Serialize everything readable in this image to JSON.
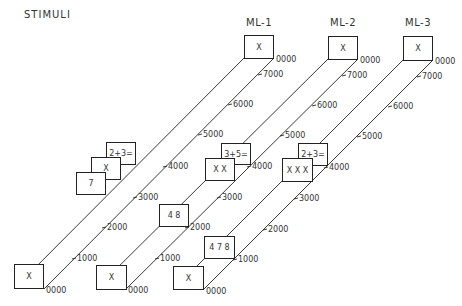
{
  "figure": {
    "stimuli_title": "STIMULI",
    "columns": [
      {
        "title": "ML-1",
        "title_pos": [
          246,
          17
        ],
        "rail": {
          "top_left": [
            244,
            58
          ],
          "top_right": [
            274,
            58
          ],
          "bot_left": [
            14,
            289
          ],
          "bot_right": [
            44,
            289
          ]
        },
        "ticks": [
          {
            "label": "0000",
            "x": 276,
            "y": 55
          },
          {
            "label": "7000",
            "x": 263,
            "y": 70
          },
          {
            "label": "6000",
            "x": 233,
            "y": 100
          },
          {
            "label": "5000",
            "x": 203,
            "y": 130
          },
          {
            "label": "4000",
            "x": 168,
            "y": 162
          },
          {
            "label": "3000",
            "x": 138,
            "y": 193
          },
          {
            "label": "2000",
            "x": 107,
            "y": 223
          },
          {
            "label": "1000",
            "x": 77,
            "y": 254
          },
          {
            "label": "0000",
            "x": 46,
            "y": 286
          }
        ],
        "boxes": [
          {
            "text": "X",
            "x": 244,
            "y": 35,
            "w": 30,
            "h": 24
          },
          {
            "text": "2+3=",
            "x": 106,
            "y": 142,
            "w": 30,
            "h": 23
          },
          {
            "text": "X",
            "x": 91,
            "y": 157,
            "w": 30,
            "h": 23
          },
          {
            "text": "7",
            "x": 76,
            "y": 172,
            "w": 30,
            "h": 23
          },
          {
            "text": "X",
            "x": 14,
            "y": 264,
            "w": 30,
            "h": 25
          }
        ]
      },
      {
        "title": "ML-2",
        "title_pos": [
          330,
          17
        ],
        "rail": {
          "top_left": [
            328,
            59
          ],
          "top_right": [
            358,
            59
          ],
          "bot_left": [
            96,
            289
          ],
          "bot_right": [
            126,
            289
          ]
        },
        "ticks": [
          {
            "label": "0000",
            "x": 360,
            "y": 56
          },
          {
            "label": "7000",
            "x": 347,
            "y": 71
          },
          {
            "label": "6000",
            "x": 317,
            "y": 101
          },
          {
            "label": "5000",
            "x": 285,
            "y": 131
          },
          {
            "label": "4000",
            "x": 252,
            "y": 162
          },
          {
            "label": "3000",
            "x": 222,
            "y": 193
          },
          {
            "label": "2000",
            "x": 190,
            "y": 223
          },
          {
            "label": "1000",
            "x": 160,
            "y": 254
          },
          {
            "label": "0000",
            "x": 128,
            "y": 286
          }
        ],
        "boxes": [
          {
            "text": "X",
            "x": 328,
            "y": 36,
            "w": 30,
            "h": 24
          },
          {
            "text": "3+5=",
            "x": 221,
            "y": 143,
            "w": 30,
            "h": 22
          },
          {
            "text": "X   X",
            "x": 205,
            "y": 158,
            "w": 30,
            "h": 23
          },
          {
            "text": "4   8",
            "x": 159,
            "y": 204,
            "w": 30,
            "h": 23
          },
          {
            "text": "X",
            "x": 96,
            "y": 265,
            "w": 31,
            "h": 25
          }
        ]
      },
      {
        "title": "ML-3",
        "title_pos": [
          405,
          17
        ],
        "rail": {
          "top_left": [
            403,
            60
          ],
          "top_right": [
            433,
            60
          ],
          "bot_left": [
            173,
            290
          ],
          "bot_right": [
            203,
            290
          ]
        },
        "ticks": [
          {
            "label": "0000",
            "x": 435,
            "y": 57
          },
          {
            "label": "7000",
            "x": 422,
            "y": 72
          },
          {
            "label": "6000",
            "x": 393,
            "y": 102
          },
          {
            "label": "5000",
            "x": 362,
            "y": 132
          },
          {
            "label": "4000",
            "x": 329,
            "y": 163
          },
          {
            "label": "3000",
            "x": 299,
            "y": 194
          },
          {
            "label": "2000",
            "x": 268,
            "y": 225
          },
          {
            "label": "1000",
            "x": 238,
            "y": 255
          },
          {
            "label": "0000",
            "x": 206,
            "y": 287
          }
        ],
        "boxes": [
          {
            "text": "X",
            "x": 403,
            "y": 36,
            "w": 30,
            "h": 25
          },
          {
            "text": "2+3=",
            "x": 298,
            "y": 143,
            "w": 30,
            "h": 23
          },
          {
            "text": "X  X  X",
            "x": 282,
            "y": 158,
            "w": 31,
            "h": 24
          },
          {
            "text": "4 7 8",
            "x": 204,
            "y": 236,
            "w": 31,
            "h": 23
          },
          {
            "text": "X",
            "x": 173,
            "y": 266,
            "w": 31,
            "h": 24
          }
        ]
      }
    ],
    "colors": {
      "line": "#222222",
      "text": "#333333",
      "background": "#ffffff"
    }
  }
}
